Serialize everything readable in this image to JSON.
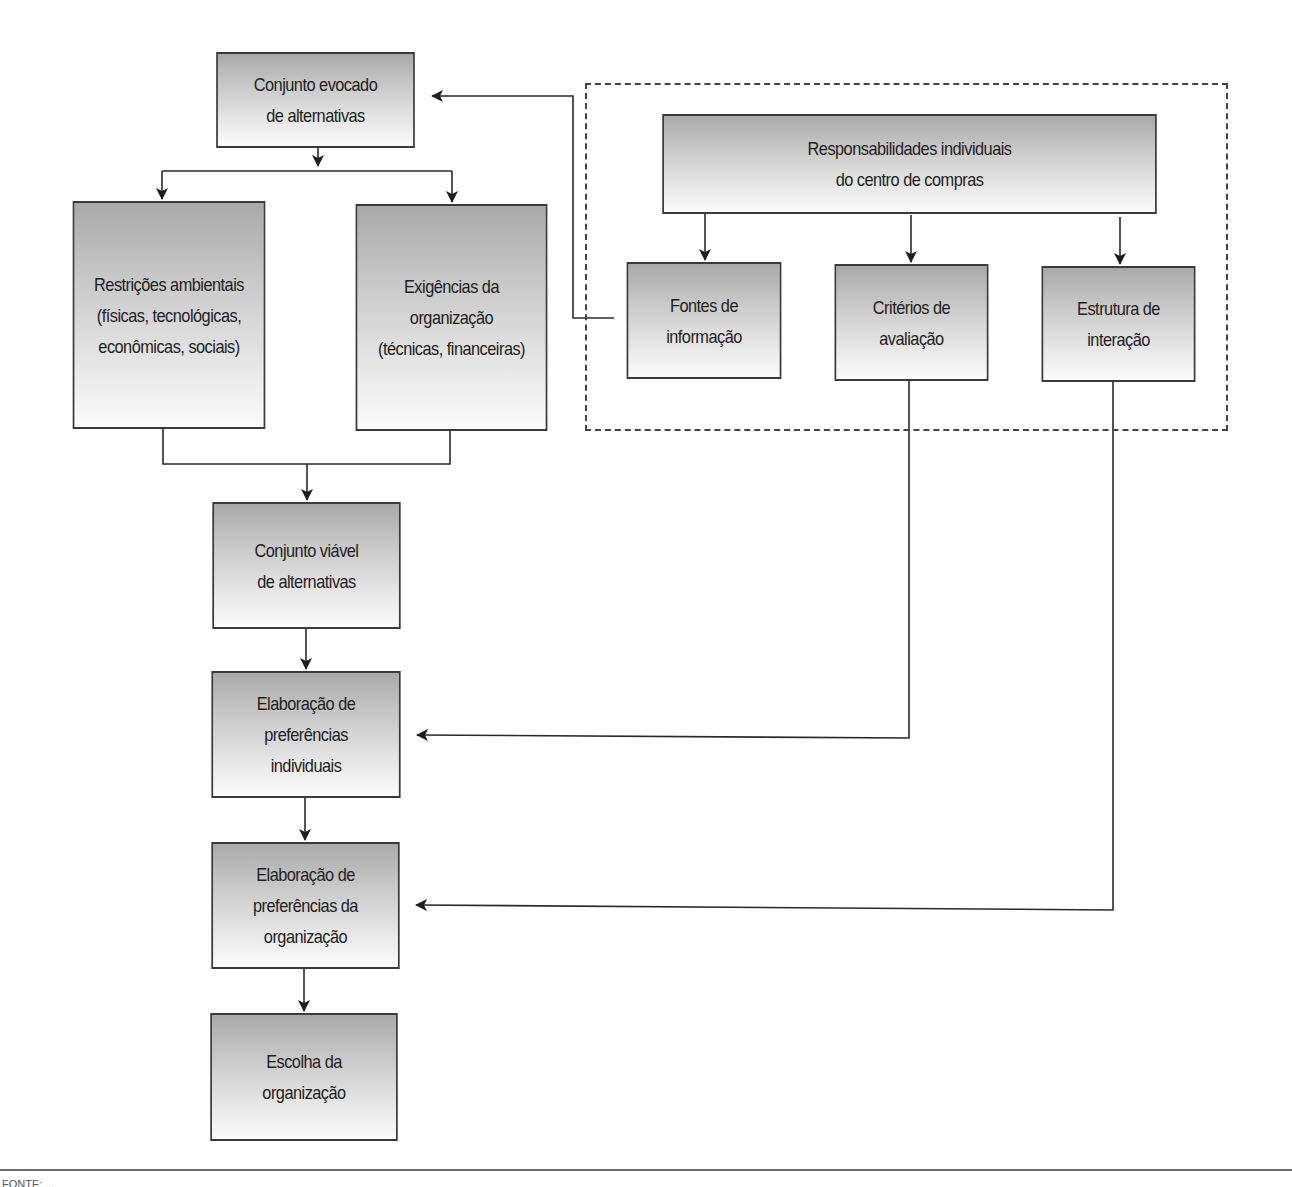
{
  "diagram": {
    "type": "flowchart",
    "language": "pt",
    "colors": {
      "box_border": "#3a3a3a",
      "box_fill_top": "#a9a9a9",
      "box_fill_bottom": "#fbfbfb",
      "connector": "#2a2a2a",
      "dashed_group_border": "#444444"
    },
    "nodes": {
      "evoked_set": {
        "label": "Conjunto evocado\nde alternativas"
      },
      "environmental_constraints": {
        "label": "Restrições ambientais\n(físicas, tecnológicas,\neconômicas, sociais)"
      },
      "organization_requirements": {
        "label": "Exigências da\norganização\n(técnicas, financeiras)"
      },
      "individual_responsibilities": {
        "label": "Responsabilidades individuais\ndo centro de compras"
      },
      "information_sources": {
        "label": "Fontes de\ninformação"
      },
      "evaluation_criteria": {
        "label": "Critérios de\navaliação"
      },
      "interaction_structure": {
        "label": "Estrutura de\ninteração"
      },
      "feasible_set": {
        "label": "Conjunto viável\nde alternativas"
      },
      "individual_preferences": {
        "label": "Elaboração de\npreferências\nindividuais"
      },
      "organization_preferences": {
        "label": "Elaboração de\npreferências da\norganização"
      },
      "organization_choice": {
        "label": "Escolha da\norganização"
      }
    },
    "edges": [
      {
        "from": "evoked_set",
        "to": "environmental_constraints"
      },
      {
        "from": "evoked_set",
        "to": "organization_requirements"
      },
      {
        "from": "information_sources",
        "to": "evoked_set"
      },
      {
        "from": "individual_responsibilities",
        "to": "information_sources"
      },
      {
        "from": "individual_responsibilities",
        "to": "evaluation_criteria"
      },
      {
        "from": "individual_responsibilities",
        "to": "interaction_structure"
      },
      {
        "from": "environmental_constraints",
        "to": "feasible_set"
      },
      {
        "from": "organization_requirements",
        "to": "feasible_set"
      },
      {
        "from": "feasible_set",
        "to": "individual_preferences"
      },
      {
        "from": "evaluation_criteria",
        "to": "individual_preferences"
      },
      {
        "from": "individual_preferences",
        "to": "organization_preferences"
      },
      {
        "from": "interaction_structure",
        "to": "organization_preferences"
      },
      {
        "from": "organization_preferences",
        "to": "organization_choice"
      }
    ],
    "groups": [
      {
        "name": "buying-center-group",
        "members": [
          "individual_responsibilities",
          "information_sources",
          "evaluation_criteria",
          "interaction_structure"
        ],
        "style": "dashed"
      }
    ]
  },
  "footer": {
    "source_text": "FONTE: ..."
  }
}
